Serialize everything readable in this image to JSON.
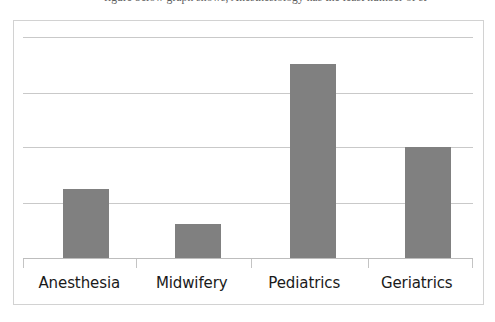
{
  "caption": {
    "text": "figure below graph shows, Anesthesiology has the least number of st"
  },
  "chart": {
    "frame_border_color": "#d2d2d2",
    "bar_color": "#808080",
    "gridline_color": "#c9c9c9",
    "axis_color": "#bdbdbd"
  },
  "chart_data": {
    "type": "bar",
    "title": "",
    "xlabel": "",
    "ylabel": "",
    "categories": [
      "Anesthesia",
      "Midwifery",
      "Pediatrics",
      "Geriatrics"
    ],
    "values": [
      1.25,
      0.62,
      3.5,
      2.0
    ],
    "ylim": [
      0,
      4
    ],
    "yticks": [
      0,
      1,
      2,
      3,
      4
    ],
    "ytick_labels": [
      "",
      "",
      "",
      "",
      ""
    ],
    "grid": true,
    "legend": false,
    "series": [
      {
        "name": "Students",
        "values": [
          1.25,
          0.62,
          3.5,
          2.0
        ],
        "color": "#808080"
      }
    ]
  }
}
